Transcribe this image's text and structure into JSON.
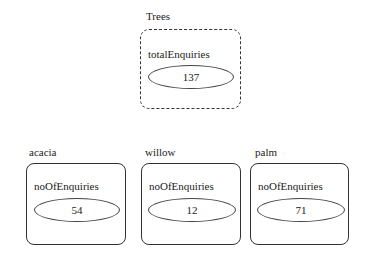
{
  "root": {
    "title": "Trees",
    "attribute": "totalEnquiries",
    "value": "137"
  },
  "children": [
    {
      "title": "acacia",
      "attribute": "noOfEnquiries",
      "value": "54"
    },
    {
      "title": "willow",
      "attribute": "noOfEnquiries",
      "value": "12"
    },
    {
      "title": "palm",
      "attribute": "noOfEnquiries",
      "value": "71"
    }
  ]
}
